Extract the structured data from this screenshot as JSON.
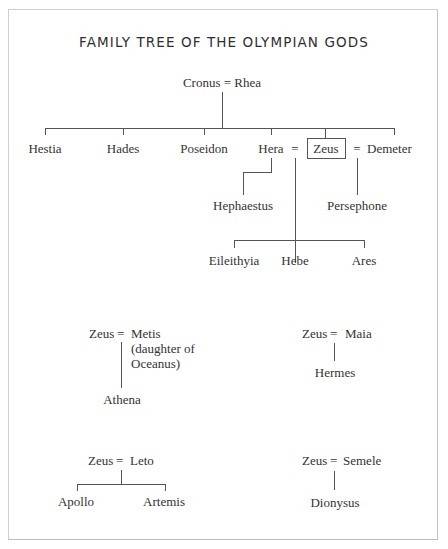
{
  "title": "FAMILY TREE OF THE OLYMPIAN GODS",
  "marriage_symbol": "=",
  "root": {
    "left": "Cronus",
    "right": "Rhea",
    "label": "Cronus = Rhea"
  },
  "children_of_cronus_rhea": [
    "Hestia",
    "Hades",
    "Poseidon",
    "Hera",
    "Zeus",
    "Demeter"
  ],
  "highlighted": "Zeus",
  "hera_children": {
    "solo": "Hephaestus",
    "with_zeus": [
      "Eileithyia",
      "Hebe",
      "Ares"
    ]
  },
  "demeter_zeus_child": "Persephone",
  "other_unions": [
    {
      "father": "Zeus",
      "mother": "Metis",
      "mother_note_1": "(daughter of",
      "mother_note_2": "Oceanus)",
      "children": [
        "Athena"
      ]
    },
    {
      "father": "Zeus",
      "mother": "Maia",
      "children": [
        "Hermes"
      ]
    },
    {
      "father": "Zeus",
      "mother": "Leto",
      "children": [
        "Apollo",
        "Artemis"
      ]
    },
    {
      "father": "Zeus",
      "mother": "Semele",
      "children": [
        "Dionysus"
      ]
    }
  ]
}
